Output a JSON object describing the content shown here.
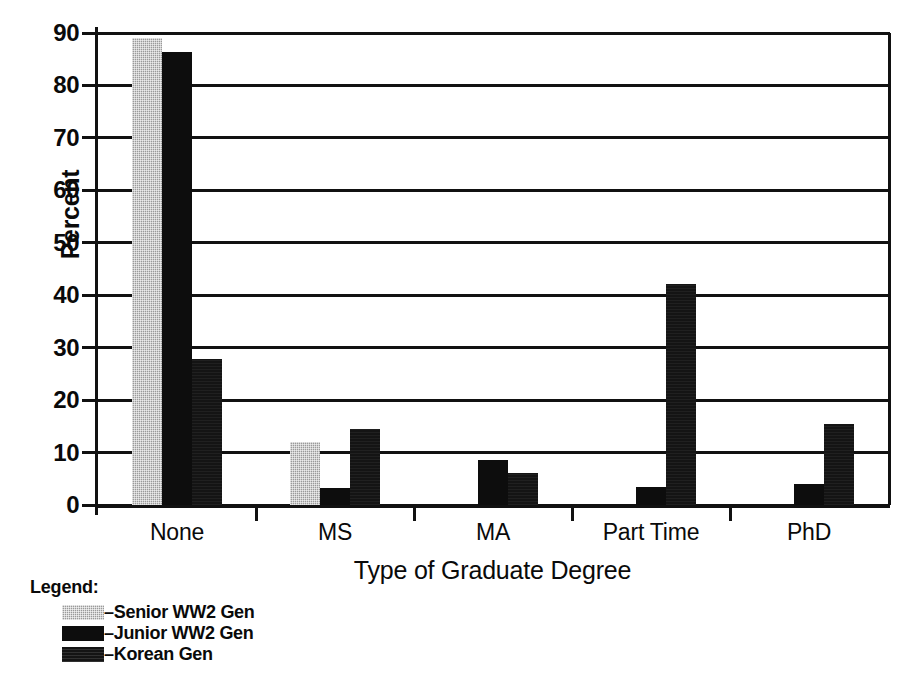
{
  "chart_data": {
    "type": "bar",
    "title": "",
    "xlabel": "Type of Graduate Degree",
    "ylabel": "Percent",
    "ylim": [
      0,
      90
    ],
    "ytick_step": 10,
    "yticks": [
      "0",
      "10",
      "20",
      "30",
      "40",
      "50",
      "60",
      "70",
      "80",
      "90"
    ],
    "grid": true,
    "legend_position": "below-left",
    "legend_title": "Legend:",
    "categories": [
      "None",
      "MS",
      "MA",
      "Part Time",
      "PhD"
    ],
    "series": [
      {
        "name": "–Senior WW2 Gen",
        "swatch": "senior",
        "color": "#9a9a9a",
        "values": [
          89,
          12,
          0,
          0,
          0
        ]
      },
      {
        "name": "–Junior WW2 Gen",
        "swatch": "junior",
        "color": "#0d0d0d",
        "values": [
          86.3,
          3.2,
          8.5,
          3.5,
          4
        ]
      },
      {
        "name": "–Korean Gen",
        "swatch": "korean",
        "color": "#141414",
        "values": [
          27.8,
          14.5,
          6.2,
          42.2,
          15.5
        ]
      }
    ]
  }
}
